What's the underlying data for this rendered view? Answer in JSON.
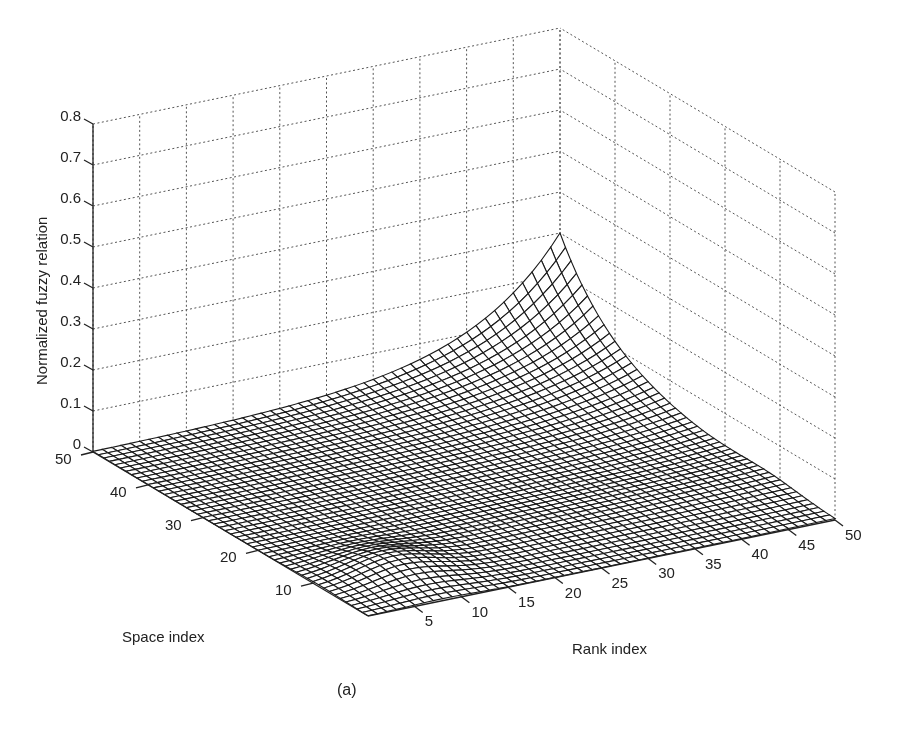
{
  "chart_data": {
    "type": "surface3d",
    "title": "",
    "caption": "(a)",
    "xlabel": "Rank index",
    "ylabel": "Space index",
    "zlabel": "Normalized fuzzy relation",
    "x_ticks": [
      "5",
      "10",
      "15",
      "20",
      "25",
      "30",
      "35",
      "40",
      "45",
      "50"
    ],
    "y_ticks": [
      "10",
      "20",
      "30",
      "40",
      "50"
    ],
    "z_ticks": [
      "0",
      "0.1",
      "0.2",
      "0.3",
      "0.4",
      "0.5",
      "0.6",
      "0.7",
      "0.8"
    ],
    "xlim": [
      0,
      50
    ],
    "ylim": [
      0,
      50
    ],
    "zlim": [
      0,
      0.8
    ],
    "grid": true,
    "grid_style": "dotted",
    "mesh_resolution": 50,
    "surface_description": "Wireframe mesh near 0 across most of the domain, rising sharply to a peak of about 0.3 at the corner Rank=50, Space=50; small local bump near Rank≈8, Space≈8",
    "peak": {
      "rank": 50,
      "space": 50,
      "value": 0.3
    },
    "local_bump": {
      "rank": 8,
      "space": 8,
      "value": 0.03
    }
  },
  "colors": {
    "mesh": "#1a1a1a",
    "grid": "#555555",
    "axis": "#222222",
    "background": "#ffffff"
  }
}
